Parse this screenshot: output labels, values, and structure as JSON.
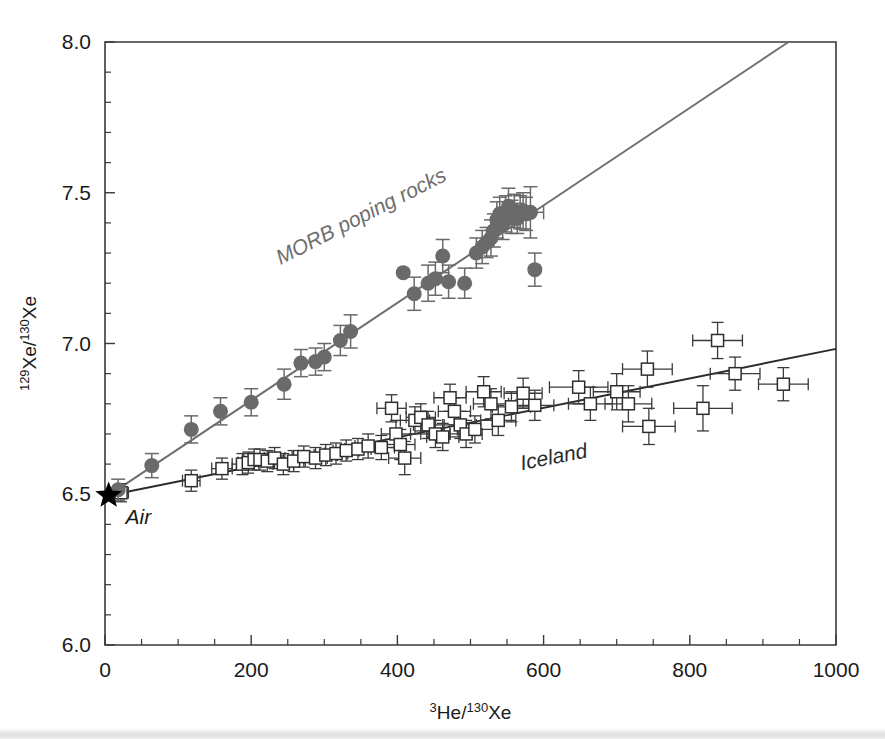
{
  "figure": {
    "background_color": "#ffffff",
    "frame_color": "#3a3a3a"
  },
  "chart_data": {
    "type": "scatter",
    "title": "",
    "xlabel_parts": {
      "sup1": "3",
      "base1": "He/",
      "sup2": "130",
      "base2": "Xe"
    },
    "ylabel_parts": {
      "sup1": "129",
      "base1": "Xe/",
      "sup2": "130",
      "base2": "Xe"
    },
    "xlabel": "3He/130Xe",
    "ylabel": "129Xe/130Xe",
    "xlim": [
      0,
      1000
    ],
    "ylim": [
      6.0,
      8.0
    ],
    "xticks": [
      0,
      200,
      400,
      600,
      800,
      1000
    ],
    "xtick_labels": [
      "0",
      "200",
      "400",
      "600",
      "800",
      "1000"
    ],
    "xticks_minor_step": 50,
    "yticks": [
      6.0,
      6.5,
      7.0,
      7.5,
      8.0
    ],
    "ytick_labels": [
      "6.0",
      "6.5",
      "7.0",
      "7.5",
      "8.0"
    ],
    "yticks_minor_step": 0.1,
    "grid": false,
    "legend_position": "in-plot-annotations",
    "annotations": [
      {
        "name": "morb-label",
        "text": "MORB poping rocks",
        "x": 240,
        "y": 7.26,
        "rotation": -27,
        "color": "#6e6e6e"
      },
      {
        "name": "iceland-label",
        "text": "Iceland",
        "x": 570,
        "y": 6.58,
        "rotation": -11,
        "color": "#2b2b2b"
      },
      {
        "name": "air-label",
        "text": "Air",
        "x": 28,
        "y": 6.4,
        "rotation": 0,
        "color": "#1a1a1a"
      }
    ],
    "series": [
      {
        "name": "Air",
        "marker": "star",
        "color": "#000000",
        "points": [
          {
            "x": 5,
            "y": 6.496
          }
        ]
      },
      {
        "name": "MORB poping rocks",
        "marker": "filled-circle",
        "color": "#6a6a6a",
        "trendline": {
          "x0": 5,
          "y0": 6.496,
          "x1": 935,
          "y1": 8.0
        },
        "points": [
          {
            "x": 18,
            "y": 6.515,
            "yerr": 0.035
          },
          {
            "x": 64,
            "y": 6.595,
            "yerr": 0.04
          },
          {
            "x": 118,
            "y": 6.715,
            "yerr": 0.045
          },
          {
            "x": 158,
            "y": 6.775,
            "yerr": 0.045
          },
          {
            "x": 200,
            "y": 6.805,
            "yerr": 0.045
          },
          {
            "x": 245,
            "y": 6.865,
            "yerr": 0.05
          },
          {
            "x": 268,
            "y": 6.935,
            "yerr": 0.045
          },
          {
            "x": 288,
            "y": 6.94,
            "yerr": 0.045
          },
          {
            "x": 300,
            "y": 6.955,
            "yerr": 0.045
          },
          {
            "x": 322,
            "y": 7.01,
            "yerr": 0.05
          },
          {
            "x": 336,
            "y": 7.04,
            "yerr": 0.055
          },
          {
            "x": 408,
            "y": 7.235,
            "yerr": 0.0
          },
          {
            "x": 423,
            "y": 7.165,
            "yerr": 0.055
          },
          {
            "x": 442,
            "y": 7.2,
            "yerr": 0.06
          },
          {
            "x": 452,
            "y": 7.215,
            "yerr": 0.055
          },
          {
            "x": 462,
            "y": 7.29,
            "yerr": 0.055
          },
          {
            "x": 470,
            "y": 7.205,
            "yerr": 0.055
          },
          {
            "x": 492,
            "y": 7.2,
            "yerr": 0.05
          },
          {
            "x": 508,
            "y": 7.3,
            "yerr": 0.05
          },
          {
            "x": 516,
            "y": 7.32,
            "yerr": 0.055
          },
          {
            "x": 522,
            "y": 7.335,
            "yerr": 0.05
          },
          {
            "x": 528,
            "y": 7.35,
            "yerr": 0.06
          },
          {
            "x": 532,
            "y": 7.375,
            "yerr": 0.055
          },
          {
            "x": 536,
            "y": 7.41,
            "yerr": 0.06
          },
          {
            "x": 540,
            "y": 7.43,
            "yerr": 0.055
          },
          {
            "x": 544,
            "y": 7.395,
            "yerr": 0.05
          },
          {
            "x": 548,
            "y": 7.43,
            "yerr": 0.06
          },
          {
            "x": 552,
            "y": 7.455,
            "yerr": 0.06
          },
          {
            "x": 556,
            "y": 7.42,
            "yerr": 0.055
          },
          {
            "x": 560,
            "y": 7.44,
            "yerr": 0.055
          },
          {
            "x": 564,
            "y": 7.415,
            "yerr": 0.05
          },
          {
            "x": 568,
            "y": 7.435,
            "yerr": 0.055
          },
          {
            "x": 572,
            "y": 7.44,
            "yerr": 0.06
          },
          {
            "x": 576,
            "y": 7.43,
            "yerr": 0.055
          },
          {
            "x": 582,
            "y": 7.435,
            "yerr": 0.085,
            "xerr": 18
          },
          {
            "x": 588,
            "y": 7.245,
            "yerr": 0.055
          }
        ]
      },
      {
        "name": "Iceland",
        "marker": "open-square",
        "color": "#2e2e2e",
        "trendline": {
          "x0": 5,
          "y0": 6.496,
          "x1": 1000,
          "y1": 6.982
        },
        "points": [
          {
            "x": 22,
            "y": 6.505,
            "yerr": 0.03,
            "xerr": 10
          },
          {
            "x": 118,
            "y": 6.545,
            "yerr": 0.035,
            "xerr": 12
          },
          {
            "x": 160,
            "y": 6.585,
            "yerr": 0.035,
            "xerr": 14
          },
          {
            "x": 188,
            "y": 6.6,
            "yerr": 0.035,
            "xerr": 14
          },
          {
            "x": 196,
            "y": 6.605,
            "yerr": 0.035,
            "xerr": 14
          },
          {
            "x": 204,
            "y": 6.615,
            "yerr": 0.035,
            "xerr": 14
          },
          {
            "x": 212,
            "y": 6.615,
            "yerr": 0.035,
            "xerr": 14
          },
          {
            "x": 222,
            "y": 6.61,
            "yerr": 0.035,
            "xerr": 16
          },
          {
            "x": 232,
            "y": 6.62,
            "yerr": 0.035,
            "xerr": 14
          },
          {
            "x": 244,
            "y": 6.6,
            "yerr": 0.035,
            "xerr": 14
          },
          {
            "x": 258,
            "y": 6.61,
            "yerr": 0.035,
            "xerr": 16
          },
          {
            "x": 272,
            "y": 6.625,
            "yerr": 0.035,
            "xerr": 16
          },
          {
            "x": 288,
            "y": 6.62,
            "yerr": 0.035,
            "xerr": 16
          },
          {
            "x": 302,
            "y": 6.63,
            "yerr": 0.035,
            "xerr": 16
          },
          {
            "x": 316,
            "y": 6.635,
            "yerr": 0.035,
            "xerr": 16
          },
          {
            "x": 330,
            "y": 6.645,
            "yerr": 0.035,
            "xerr": 18
          },
          {
            "x": 346,
            "y": 6.65,
            "yerr": 0.035,
            "xerr": 18
          },
          {
            "x": 360,
            "y": 6.66,
            "yerr": 0.04,
            "xerr": 18
          },
          {
            "x": 378,
            "y": 6.655,
            "yerr": 0.04,
            "xerr": 18
          },
          {
            "x": 392,
            "y": 6.785,
            "yerr": 0.045,
            "xerr": 20
          },
          {
            "x": 398,
            "y": 6.7,
            "yerr": 0.045,
            "xerr": 20
          },
          {
            "x": 404,
            "y": 6.665,
            "yerr": 0.05,
            "xerr": 20
          },
          {
            "x": 410,
            "y": 6.62,
            "yerr": 0.055,
            "xerr": 22
          },
          {
            "x": 424,
            "y": 6.745,
            "yerr": 0.045,
            "xerr": 20
          },
          {
            "x": 432,
            "y": 6.755,
            "yerr": 0.045,
            "xerr": 20
          },
          {
            "x": 442,
            "y": 6.73,
            "yerr": 0.045,
            "xerr": 20
          },
          {
            "x": 452,
            "y": 6.7,
            "yerr": 0.045,
            "xerr": 20
          },
          {
            "x": 462,
            "y": 6.69,
            "yerr": 0.045,
            "xerr": 22
          },
          {
            "x": 472,
            "y": 6.82,
            "yerr": 0.045,
            "xerr": 22
          },
          {
            "x": 478,
            "y": 6.775,
            "yerr": 0.045,
            "xerr": 22
          },
          {
            "x": 486,
            "y": 6.73,
            "yerr": 0.045,
            "xerr": 22
          },
          {
            "x": 494,
            "y": 6.7,
            "yerr": 0.045,
            "xerr": 22
          },
          {
            "x": 506,
            "y": 6.715,
            "yerr": 0.045,
            "xerr": 24
          },
          {
            "x": 518,
            "y": 6.84,
            "yerr": 0.05,
            "xerr": 24
          },
          {
            "x": 528,
            "y": 6.8,
            "yerr": 0.05,
            "xerr": 24
          },
          {
            "x": 538,
            "y": 6.745,
            "yerr": 0.05,
            "xerr": 24
          },
          {
            "x": 556,
            "y": 6.79,
            "yerr": 0.05,
            "xerr": 26
          },
          {
            "x": 572,
            "y": 6.835,
            "yerr": 0.05,
            "xerr": 26
          },
          {
            "x": 588,
            "y": 6.795,
            "yerr": 0.05,
            "xerr": 26
          },
          {
            "x": 648,
            "y": 6.855,
            "yerr": 0.055,
            "xerr": 40
          },
          {
            "x": 664,
            "y": 6.8,
            "yerr": 0.055,
            "xerr": 30
          },
          {
            "x": 700,
            "y": 6.84,
            "yerr": 0.06,
            "xerr": 32
          },
          {
            "x": 716,
            "y": 6.8,
            "yerr": 0.06,
            "xerr": 32
          },
          {
            "x": 742,
            "y": 6.915,
            "yerr": 0.06,
            "xerr": 34
          },
          {
            "x": 744,
            "y": 6.725,
            "yerr": 0.06,
            "xerr": 36
          },
          {
            "x": 818,
            "y": 6.785,
            "yerr": 0.075,
            "xerr": 40
          },
          {
            "x": 838,
            "y": 7.01,
            "yerr": 0.06,
            "xerr": 34
          },
          {
            "x": 862,
            "y": 6.9,
            "yerr": 0.055,
            "xerr": 34
          },
          {
            "x": 928,
            "y": 6.865,
            "yerr": 0.055,
            "xerr": 34
          }
        ]
      }
    ]
  }
}
